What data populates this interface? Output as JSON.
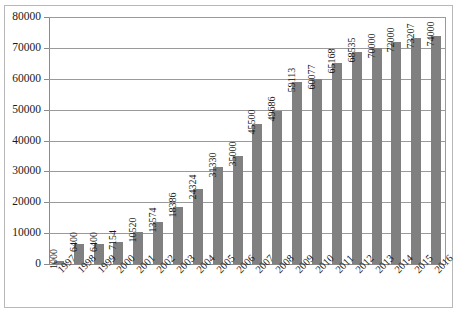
{
  "chart_data": {
    "type": "bar",
    "title": "",
    "subtitle": "",
    "xlabel": "",
    "ylabel": "",
    "legend": [],
    "grid": true,
    "ylim": [
      0,
      80000
    ],
    "ytick_labels": [
      "80000",
      "70000",
      "60000",
      "50000",
      "40000",
      "30000",
      "20000",
      "10000",
      "0"
    ],
    "ytick_values": [
      80000,
      70000,
      60000,
      50000,
      40000,
      30000,
      20000,
      10000,
      0
    ],
    "categories": [
      "1997",
      "1998",
      "1999",
      "2000",
      "2001",
      "2002",
      "2003",
      "2004",
      "2005",
      "2006",
      "2007",
      "2008",
      "2009",
      "2010",
      "2011",
      "2012",
      "2013",
      "2014",
      "2015",
      "2016"
    ],
    "values": [
      1000,
      6400,
      6400,
      7154,
      10520,
      13574,
      18386,
      24324,
      31330,
      35000,
      45500,
      49686,
      59113,
      60077,
      65168,
      68535,
      70000,
      72000,
      73207,
      74000
    ],
    "value_labels": [
      "1000",
      "6400",
      "6400",
      "7154",
      "10520",
      "13574",
      "18386",
      "24324",
      "31330",
      "35000",
      "45500",
      "49686",
      "59113",
      "60077",
      "65168",
      "68535",
      "70000",
      "72000",
      "73207",
      "74000"
    ],
    "bar_color": "#808080",
    "gridline_color": "#9a9a9a",
    "axis_color": "#8a8a8a",
    "frame_color": "#b8b8b8",
    "text_color": "#1a1a1a",
    "background": "#ffffff"
  }
}
